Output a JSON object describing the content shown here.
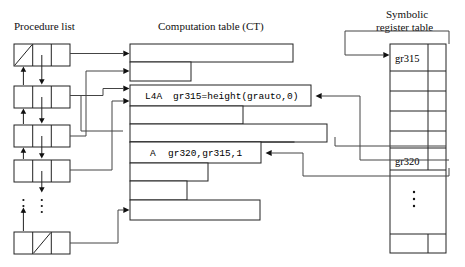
{
  "titles": {
    "procedure_list": "Procedure list",
    "computation_table": "Computation table (CT)",
    "symbolic_register_line1": "Symbolic",
    "symbolic_register_line2": "register table"
  },
  "computation_table": {
    "rows": [
      {
        "label": "",
        "text": "",
        "width": 163,
        "filled": false
      },
      {
        "label": "",
        "text": "",
        "width": 61,
        "filled": false
      },
      {
        "label": "L4A",
        "text": "gr315=height(grauto,0)",
        "width": 181,
        "filled": true
      },
      {
        "label": "",
        "text": "",
        "width": 113,
        "filled": false
      },
      {
        "label": "",
        "text": "",
        "width": 197,
        "filled": false
      },
      {
        "label": "",
        "text": "",
        "width": 164,
        "filled": false
      },
      {
        "label": "A",
        "text": "gr320,gr315,1",
        "width": 131,
        "filled": true
      },
      {
        "label": "",
        "text": "",
        "width": 78,
        "filled": false
      },
      {
        "label": "",
        "text": "",
        "width": 57,
        "filled": false
      },
      {
        "label": "",
        "text": "",
        "width": 130,
        "filled": false
      }
    ]
  },
  "symbolic_register_table": {
    "rows": [
      {
        "value": "gr315"
      },
      {
        "value": ""
      },
      {
        "value": ""
      },
      {
        "value": ""
      },
      {
        "value": ""
      },
      {
        "value": "gr320"
      },
      {
        "value": ""
      },
      {
        "value": ""
      }
    ],
    "ellipsis": "⋮"
  },
  "procedure_list": {
    "nodes": [
      {
        "slash_cell": 0
      },
      {
        "slash_cell": -1
      },
      {
        "slash_cell": -1
      },
      {
        "slash_cell": -1
      },
      {
        "slash_cell": 1
      }
    ],
    "ellipsis": "⋮"
  },
  "colors": {
    "stroke": "#222222",
    "connector": "#444444",
    "background": "#ffffff",
    "text": "#111111"
  }
}
